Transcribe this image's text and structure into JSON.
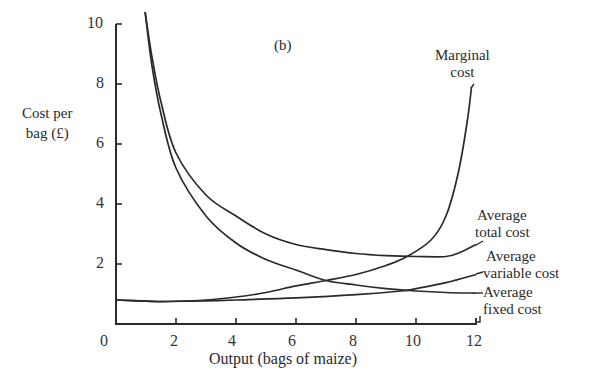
{
  "chart_data": {
    "type": "line",
    "panel_label": "(b)",
    "title": "",
    "xlabel": "Output (bags of maize)",
    "ylabel": "Cost per bag (£)",
    "xlim": [
      0,
      12
    ],
    "ylim": [
      0,
      10
    ],
    "x_ticks": [
      0,
      2,
      4,
      6,
      8,
      10,
      12
    ],
    "y_ticks": [
      2,
      4,
      6,
      8,
      10
    ],
    "grid": false,
    "legend": "inline labels at right end of curves",
    "series": [
      {
        "name": "Marginal cost",
        "x": [
          0,
          1,
          1.7,
          3,
          4,
          5,
          6,
          7,
          8,
          9,
          9.7,
          10.5,
          11,
          11.4,
          11.7,
          11.85
        ],
        "y": [
          0.8,
          0.76,
          0.75,
          0.8,
          0.9,
          1.05,
          1.27,
          1.45,
          1.65,
          1.95,
          2.25,
          2.8,
          3.6,
          5.0,
          6.7,
          7.9
        ]
      },
      {
        "name": "Average total cost",
        "x": [
          0.97,
          1.2,
          1.5,
          2,
          3,
          4,
          5,
          6,
          7,
          8,
          9,
          10,
          11,
          11.5,
          12
        ],
        "y": [
          10.4,
          8.9,
          7.4,
          5.7,
          4.3,
          3.6,
          3.0,
          2.65,
          2.48,
          2.35,
          2.28,
          2.25,
          2.25,
          2.4,
          2.65
        ]
      },
      {
        "name": "Average variable cost",
        "x": [
          0,
          1,
          1.7,
          3,
          4,
          6,
          8,
          9.5,
          10,
          11,
          12
        ],
        "y": [
          0.8,
          0.76,
          0.75,
          0.77,
          0.8,
          0.87,
          0.98,
          1.1,
          1.18,
          1.38,
          1.65
        ]
      },
      {
        "name": "Average fixed cost",
        "x": [
          0.97,
          1.2,
          1.5,
          2,
          3,
          4,
          5,
          6,
          7,
          8,
          9,
          10,
          11,
          12
        ],
        "y": [
          10.4,
          8.6,
          7.0,
          5.2,
          3.6,
          2.7,
          2.15,
          1.8,
          1.45,
          1.3,
          1.18,
          1.1,
          1.05,
          1.03
        ]
      }
    ],
    "annotations": [
      "Marginal cost",
      "Average total cost",
      "Average variable cost",
      "Average fixed cost"
    ]
  },
  "labels": {
    "panel": "(b)",
    "ylabel_line1": "Cost per",
    "ylabel_line2": "bag (£)",
    "xlabel": "Output (bags of maize)",
    "mc_line1": "Marginal",
    "mc_line2": "cost",
    "atc_line1": "Average",
    "atc_line2": "total cost",
    "avc_line1": "Average",
    "avc_line2": "variable cost",
    "afc_line1": "Average",
    "afc_line2": "fixed cost"
  },
  "ticks": {
    "x": [
      "0",
      "2",
      "4",
      "6",
      "8",
      "10",
      "12"
    ],
    "y": [
      "2",
      "4",
      "6",
      "8",
      "10"
    ]
  }
}
